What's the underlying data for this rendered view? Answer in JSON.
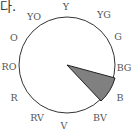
{
  "caption_fragment": "다.",
  "wheel": {
    "center": [
      67,
      65
    ],
    "radius": 48,
    "stroke": "#333333",
    "labels": [
      {
        "text": "Y",
        "x": 66,
        "y": 10
      },
      {
        "text": "YG",
        "x": 104,
        "y": 18
      },
      {
        "text": "G",
        "x": 118,
        "y": 40
      },
      {
        "text": "BG",
        "x": 124,
        "y": 71
      },
      {
        "text": "B",
        "x": 120,
        "y": 101
      },
      {
        "text": "BV",
        "x": 100,
        "y": 121
      },
      {
        "text": "V",
        "x": 64,
        "y": 129
      },
      {
        "text": "RV",
        "x": 37,
        "y": 121
      },
      {
        "text": "R",
        "x": 14,
        "y": 101
      },
      {
        "text": "RO",
        "x": 9,
        "y": 70
      },
      {
        "text": "O",
        "x": 14,
        "y": 41
      },
      {
        "text": "YO",
        "x": 34,
        "y": 20
      }
    ],
    "highlight_sector": {
      "label": "B",
      "fill": "#808080",
      "vertex": [
        67,
        65
      ],
      "start": [
        115,
        78
      ],
      "end": [
        101,
        101
      ]
    }
  }
}
